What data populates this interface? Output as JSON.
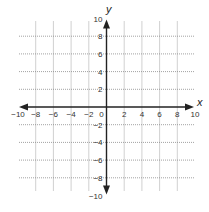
{
  "chart_data": {
    "type": "scatter",
    "title": "",
    "xlabel": "x",
    "ylabel": "y",
    "xlim": [
      -10,
      10
    ],
    "ylim": [
      -10,
      10
    ],
    "grid": true,
    "grid_step": 2,
    "x_ticks": [
      -10,
      -8,
      -6,
      -4,
      -2,
      0,
      2,
      4,
      6,
      8,
      10
    ],
    "y_ticks": [
      -10,
      -8,
      -6,
      -4,
      -2,
      2,
      4,
      6,
      8,
      10
    ],
    "x_tick_labels": [
      "−10",
      "−8",
      "−6",
      "−4",
      "−2",
      "0",
      "2",
      "4",
      "6",
      "8",
      "10"
    ],
    "y_tick_labels": [
      "−10",
      "−8",
      "−6",
      "−4",
      "−2",
      "2",
      "4",
      "6",
      "8",
      "10"
    ],
    "series": [],
    "legend": null
  },
  "layout": {
    "origin_px": [
      106.5,
      107
    ],
    "unit_px": 8.85,
    "grid_color": "#8a8a8a",
    "axis_color": "#222222"
  }
}
